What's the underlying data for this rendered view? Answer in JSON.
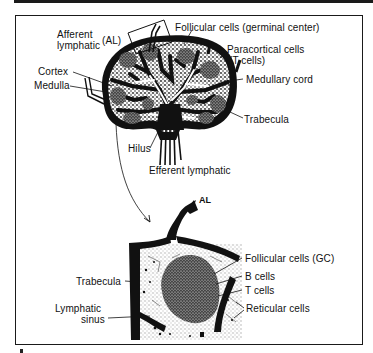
{
  "figure": {
    "panel_label": "A",
    "colors": {
      "ink": "#111111",
      "paper": "#ffffff",
      "stipple": "#333333"
    }
  },
  "top_diagram": {
    "title": "Lymph node (whole)",
    "labels": {
      "afferent_lymphatic_line1": "Afferent",
      "afferent_lymphatic_line2": "lymphatic",
      "al_abbrev": "(AL)",
      "follicular_cells": "Follicular cells (germinal center)",
      "paracortical_line1": "Paracortical cells",
      "paracortical_line2": "(T cells)",
      "cortex": "Cortex",
      "medulla": "Medulla",
      "medullary_cord": "Medullary cord",
      "trabecula": "Trabecula",
      "hilus": "Hilus",
      "efferent_lymphatic": "Efferent lymphatic"
    }
  },
  "bottom_diagram": {
    "title": "Enlarged cortex region",
    "labels": {
      "al": "AL",
      "follicular_cells_gc": "Follicular cells (GC)",
      "b_cells": "B cells",
      "t_cells": "T cells",
      "reticular_cells": "Reticular cells",
      "trabecula": "Trabecula",
      "lymphatic_sinus_line1": "Lymphatic",
      "lymphatic_sinus_line2": "sinus"
    }
  }
}
